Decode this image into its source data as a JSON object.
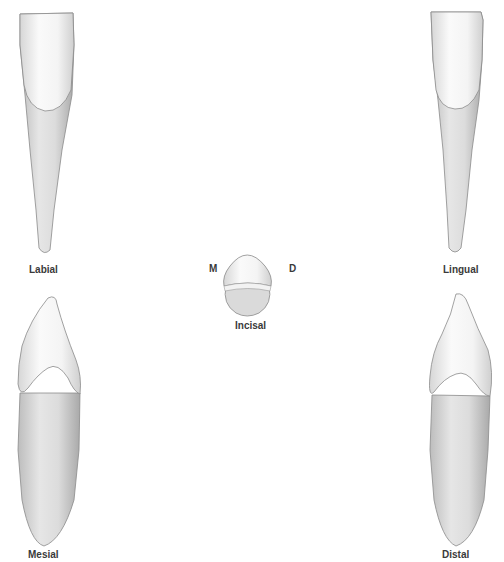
{
  "figure": {
    "views": [
      {
        "id": "labial",
        "label": "Labial"
      },
      {
        "id": "lingual",
        "label": "Lingual"
      },
      {
        "id": "incisal",
        "label": "Incisal"
      },
      {
        "id": "mesial",
        "label": "Mesial"
      },
      {
        "id": "distal",
        "label": "Distal"
      }
    ],
    "orientation": {
      "mesial_marker": "M",
      "distal_marker": "D"
    }
  }
}
